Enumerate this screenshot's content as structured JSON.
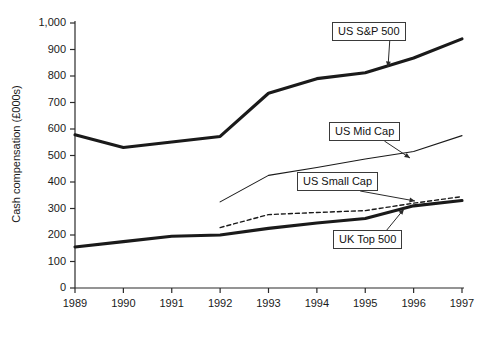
{
  "chart_data": {
    "type": "line",
    "title": "",
    "subtitle": "",
    "xlabel": "",
    "ylabel": "Cash compensation (£000s)",
    "x": [
      1989,
      1990,
      1991,
      1992,
      1993,
      1994,
      1995,
      1996,
      1997
    ],
    "xticklabels": [
      "1989",
      "1990",
      "1991",
      "1992",
      "1993",
      "1994",
      "1995",
      "1996",
      "1997"
    ],
    "yticklabels": [
      "0",
      "100",
      "200",
      "300",
      "400",
      "500",
      "600",
      "700",
      "800",
      "900",
      "1,000"
    ],
    "ytickvalues": [
      0,
      100,
      200,
      300,
      400,
      500,
      600,
      700,
      800,
      900,
      1000
    ],
    "xlim": [
      1989,
      1997
    ],
    "ylim": [
      0,
      1000
    ],
    "grid": false,
    "legend_position": "inline-callouts",
    "series": [
      {
        "name": "US S&P 500",
        "style": "solid-thick",
        "color": "#1a1a1a",
        "x": [
          1989,
          1990,
          1991,
          1992,
          1993,
          1994,
          1995,
          1996,
          1997
        ],
        "values": [
          578,
          530,
          551,
          572,
          735,
          790,
          812,
          868,
          940
        ]
      },
      {
        "name": "US Mid Cap",
        "style": "solid-thin",
        "color": "#1a1a1a",
        "x": [
          1992,
          1993,
          1994,
          1995,
          1996,
          1997
        ],
        "values": [
          325,
          425,
          455,
          487,
          515,
          575
        ]
      },
      {
        "name": "US Small Cap",
        "style": "dashed",
        "color": "#1a1a1a",
        "x": [
          1992,
          1993,
          1994,
          1995,
          1996,
          1997
        ],
        "values": [
          228,
          277,
          285,
          292,
          320,
          345
        ]
      },
      {
        "name": "UK Top 500",
        "style": "solid-thick",
        "color": "#1a1a1a",
        "x": [
          1989,
          1990,
          1991,
          1992,
          1993,
          1994,
          1995,
          1996,
          1997
        ],
        "values": [
          155,
          175,
          195,
          200,
          225,
          245,
          262,
          310,
          330
        ]
      }
    ],
    "annotations": [
      {
        "label": "US S&P 500",
        "box_x": 332,
        "box_y": 22,
        "arrow_to_x": 388,
        "arrow_to_y": 67
      },
      {
        "label": "US Mid Cap",
        "box_x": 329,
        "box_y": 122,
        "arrow_to_x": 410,
        "arrow_to_y": 158
      },
      {
        "label": "US Small Cap",
        "box_x": 297,
        "box_y": 172,
        "arrow_to_x": 415,
        "arrow_to_y": 201
      },
      {
        "label": "UK Top 500",
        "box_x": 333,
        "box_y": 230,
        "arrow_to_x": 404,
        "arrow_to_y": 209
      }
    ]
  }
}
